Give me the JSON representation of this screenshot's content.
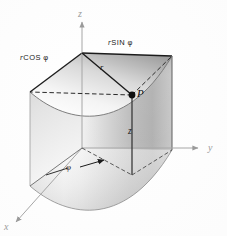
{
  "figure": {
    "name": "cylindrical-coordinates-diagram",
    "caption": "",
    "background_color": "#ffffff",
    "ink_color": "#1b1b1b",
    "axis_color": "#9a9a9a",
    "surface_light": "#fdfdfd",
    "surface_mid": "#c9c9c9",
    "surface_dark": "#8e8e8e"
  },
  "axes": {
    "z_label": "z",
    "y_label": "y",
    "x_label": "x"
  },
  "labels": {
    "r_cos_phi_prefix": "r",
    "r_cos_phi_rest": "COS",
    "r_cos_phi_symbol": "φ",
    "r_sin_phi_prefix": "r",
    "r_sin_phi_rest": "SIN",
    "r_sin_phi_symbol": "φ",
    "radius": "r",
    "point": "P",
    "height": "z",
    "angle": "φ"
  },
  "geometry": {
    "origin": {
      "x": 80,
      "y": 148
    },
    "point_p": {
      "x": 132,
      "y": 95
    },
    "z_axis_top": {
      "x": 82,
      "y": 18
    },
    "y_axis_end": {
      "x": 203,
      "y": 148
    },
    "x_axis_end": {
      "x": 12,
      "y": 226
    },
    "top_apex": {
      "x": 82,
      "y": 53
    },
    "top_left_corner": {
      "x": 30,
      "y": 92
    },
    "top_right_corner": {
      "x": 172,
      "y": 56
    },
    "bottom_left_corner": {
      "x": 30,
      "y": 186
    },
    "bottom_right_corner": {
      "x": 172,
      "y": 150
    },
    "base_front": {
      "x": 132,
      "y": 175
    }
  }
}
